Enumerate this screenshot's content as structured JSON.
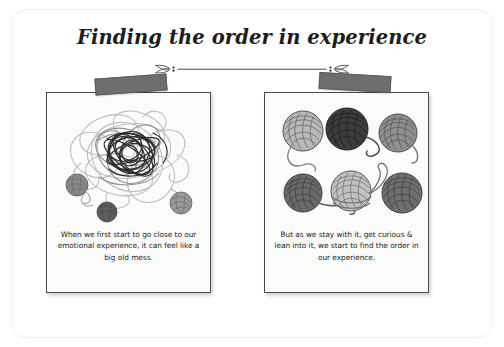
{
  "poster": {
    "title": "Finding the order in experience",
    "background_color": "#ffffff",
    "frame_color": "#f0f0f0",
    "divider": {
      "icon_left": "leaf-flourish-icon",
      "icon_right": "leaf-flourish-icon",
      "line_color": "#4a4a4a"
    }
  },
  "cards": [
    {
      "id": "left",
      "tape_name": "tape-strip-left",
      "tape_color": "#6e6e6e",
      "illustration": "tangled-yarn-illustration",
      "caption": "When we first start to go close to our emotional experience, it can feel like a big old mess."
    },
    {
      "id": "right",
      "tape_name": "tape-strip-right",
      "tape_color": "#6e6e6e",
      "illustration": "ordered-yarn-balls-illustration",
      "caption": "But as we stay with it, get curious & lean into it, we start to find the order in our experience."
    }
  ],
  "yarn_balls_right": [
    {
      "position": "top-left",
      "shade": "#b9b9b9"
    },
    {
      "position": "top-center",
      "shade": "#3c3c3c"
    },
    {
      "position": "top-right",
      "shade": "#8f8f8f"
    },
    {
      "position": "bottom-left",
      "shade": "#6a6a6a"
    },
    {
      "position": "bottom-center",
      "shade": "#c2c2c2"
    },
    {
      "position": "bottom-right",
      "shade": "#6f6f6f"
    }
  ],
  "yarn_balls_left": [
    {
      "position": "left-edge",
      "shade": "#8a8a8a"
    },
    {
      "position": "bottom-left",
      "shade": "#5e5e5e"
    },
    {
      "position": "bottom-right",
      "shade": "#9a9a9a"
    }
  ]
}
